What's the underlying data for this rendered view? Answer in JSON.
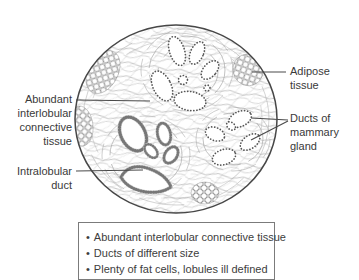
{
  "figure": {
    "labels": {
      "abundant": "Abundant\ninterlobular\nconnective\ntissue",
      "intralobular": "Intralobular\nduct",
      "adipose": "Adipose\ntissue",
      "ducts": "Ducts of\nmammary\ngland"
    },
    "notes": {
      "bullet_char": "•",
      "items": [
        "Abundant interlobular connective tissue",
        "Ducts of different size",
        "Plenty of fat cells, lobules ill defined"
      ]
    },
    "colors": {
      "ink": "#3a3a3a",
      "outline": "#474747",
      "fiber": "#a8a8a8",
      "cell_dot": "#555555",
      "box_border": "#7b7b7b"
    }
  }
}
